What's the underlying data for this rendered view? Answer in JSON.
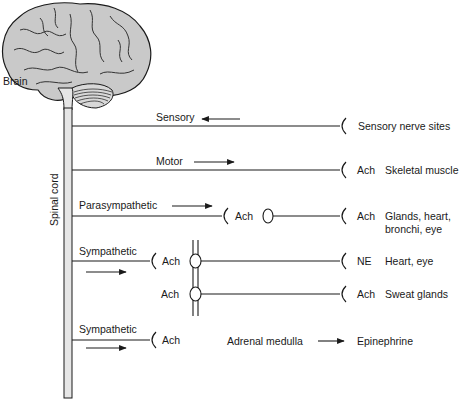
{
  "labels": {
    "brain": "Brain",
    "spinal_cord": "Spinal cord"
  },
  "rows": [
    {
      "name": "Sensory",
      "transmitter": "",
      "target": "Sensory nerve sites",
      "direction": "left"
    },
    {
      "name": "Motor",
      "transmitter": "Ach",
      "target": "Skeletal muscle",
      "direction": "right"
    },
    {
      "name": "Parasympathetic",
      "ganglion_transmitter": "Ach",
      "transmitter": "Ach",
      "target_line1": "Glands, heart,",
      "target_line2": "bronchi, eye",
      "direction": "right"
    },
    {
      "name": "Sympathetic",
      "ganglion_transmitter": "Ach",
      "transmitter": "NE",
      "target": "Heart, eye",
      "direction": "right"
    },
    {
      "name": "",
      "ganglion_transmitter": "Ach",
      "transmitter": "Ach",
      "target": "Sweat glands"
    },
    {
      "name": "Sympathetic",
      "ganglion_transmitter": "Ach",
      "organ": "Adrenal medulla",
      "product": "Epinephrine",
      "direction": "right"
    }
  ],
  "colors": {
    "line": "#1a1a1a",
    "brain_fill": "#c9c9c9",
    "cord_fill": "#e6e6e6"
  }
}
